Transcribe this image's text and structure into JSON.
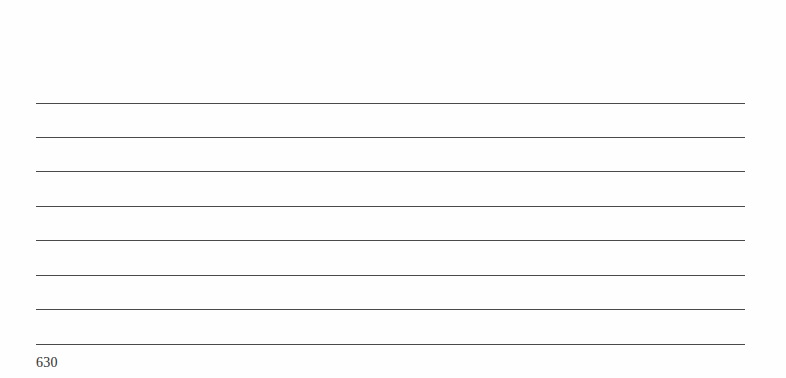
{
  "document": {
    "type": "ruled-writing-page",
    "ruled_lines": {
      "count": 8,
      "y_positions": [
        103,
        137,
        171,
        206,
        240,
        275,
        309,
        344
      ],
      "color": "#4a4a4a"
    },
    "page_number": "630"
  }
}
